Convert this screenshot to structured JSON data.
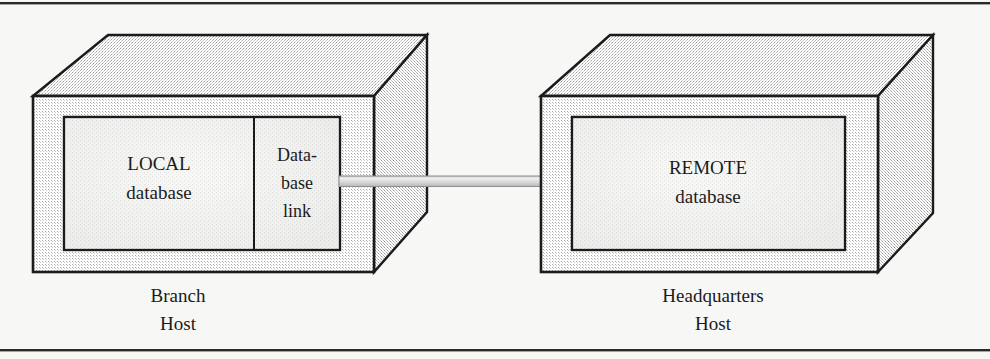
{
  "figure": {
    "type": "network-diagram",
    "background_color": "#f7f7f5",
    "line_color": "#1b1b1b",
    "face_front_color": "#d8d8d8",
    "face_top_color": "#cfcfcf",
    "face_side_color": "#c6c6c6",
    "panel_color": "#e8e8e6",
    "cable_color": "#d0d0d0"
  },
  "left_host": {
    "host_label_line1": "Branch",
    "host_label_line2": "Host",
    "database": {
      "name_line1": "LOCAL",
      "name_line2": "database"
    },
    "link": {
      "name_line1": "Data-",
      "name_line2": "base",
      "name_line3": "link"
    }
  },
  "right_host": {
    "host_label_line1": "Headquarters",
    "host_label_line2": "Host",
    "database": {
      "name_line1": "REMOTE",
      "name_line2": "database"
    }
  },
  "connector": {
    "name": "database-link-cable"
  },
  "rules": {
    "top": "",
    "bottom": ""
  }
}
